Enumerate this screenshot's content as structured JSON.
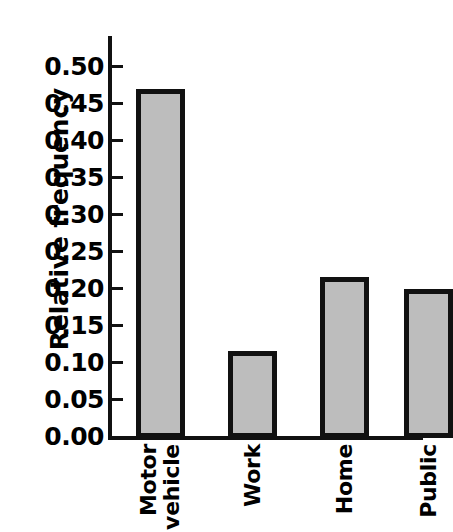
{
  "chart_data": {
    "type": "bar",
    "title": "",
    "xlabel": "",
    "ylabel": "Relative frequency",
    "categories": [
      "Motor vehicle",
      "Work",
      "Home",
      "Public"
    ],
    "category_lines": [
      [
        "Motor",
        "vehicle"
      ],
      [
        "Work"
      ],
      [
        "Home"
      ],
      [
        "Public"
      ]
    ],
    "values": [
      0.471,
      0.117,
      0.218,
      0.202
    ],
    "ylim": [
      0.0,
      0.5
    ],
    "ytick_step": 0.05,
    "ytick_labels": [
      "0.00",
      "0.05",
      "0.10",
      "0.15",
      "0.20",
      "0.25",
      "0.30",
      "0.35",
      "0.40",
      "0.45",
      "0.50"
    ],
    "ytick_values": [
      0.0,
      0.05,
      0.1,
      0.15,
      0.2,
      0.25,
      0.3,
      0.35,
      0.4,
      0.45,
      0.5
    ],
    "grid": false,
    "legend": false,
    "bar_fill_color": "#bdbdbd",
    "bar_border_color": "#111111",
    "axis_color": "#111111",
    "background_color": "#ffffff"
  }
}
